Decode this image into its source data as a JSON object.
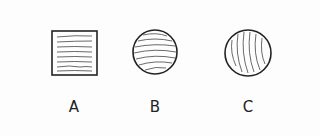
{
  "figures": [
    {
      "label": "A",
      "shape": "square",
      "hatching": "horizontal",
      "cx": 74,
      "cy": 53,
      "size": 45
    },
    {
      "label": "B",
      "shape": "circle",
      "hatching": "horizontal-curved",
      "cx": 155,
      "cy": 52,
      "r": 22
    },
    {
      "label": "C",
      "shape": "circle",
      "hatching": "vertical-curved",
      "cx": 248,
      "cy": 53,
      "r": 23
    }
  ],
  "colors": {
    "stroke": "#222222",
    "background": "#fdfdfd"
  }
}
